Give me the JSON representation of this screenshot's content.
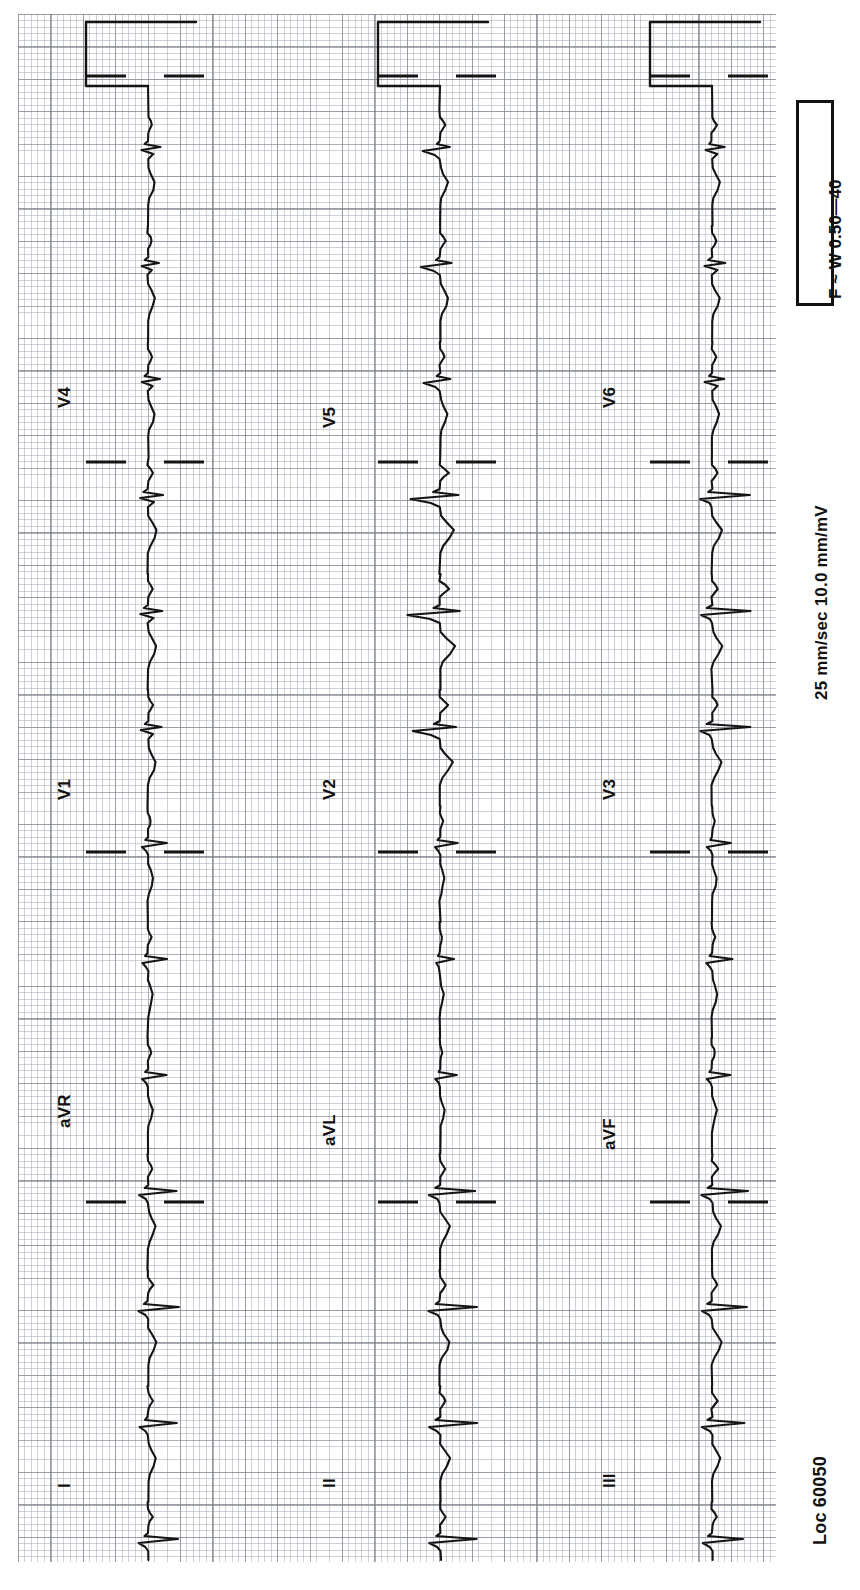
{
  "document": {
    "type": "12-lead-electrocardiogram",
    "orientation": "rotated-90-ccw",
    "paper": {
      "small_box_px": 6.48,
      "large_box_px": 32.4,
      "grid_color_minor": "#969ba5",
      "grid_color_major": "#787d87",
      "background": "#ffffff",
      "trace_color": "#111111"
    }
  },
  "settings": {
    "paper_speed": "25 mm/sec",
    "gain": "10.0 mm/mV",
    "speed_gain_line": "25 mm/sec   10.0 mm/mV",
    "filter": "F ~ W 0.50—40",
    "location": "Loc 60050"
  },
  "leads": {
    "columns": [
      {
        "name": "column-1",
        "baseline_x": 148,
        "labels": [
          {
            "text": "I",
            "x": 55,
            "y": 1488
          },
          {
            "text": "aVR",
            "x": 55,
            "y": 1128
          },
          {
            "text": "V1",
            "x": 55,
            "y": 800
          },
          {
            "text": "V4",
            "x": 55,
            "y": 408
          }
        ]
      },
      {
        "name": "column-2",
        "baseline_x": 440,
        "labels": [
          {
            "text": "II",
            "x": 320,
            "y": 1488
          },
          {
            "text": "aVL",
            "x": 320,
            "y": 1146
          },
          {
            "text": "V2",
            "x": 320,
            "y": 800
          },
          {
            "text": "V5",
            "x": 320,
            "y": 428
          }
        ]
      },
      {
        "name": "column-3",
        "baseline_x": 712,
        "labels": [
          {
            "text": "III",
            "x": 600,
            "y": 1488
          },
          {
            "text": "aVF",
            "x": 600,
            "y": 1150
          },
          {
            "text": "V3",
            "x": 600,
            "y": 800
          },
          {
            "text": "V6",
            "x": 600,
            "y": 408
          }
        ]
      }
    ],
    "order_top_to_bottom": [
      "V4/V5/V6",
      "V1/V2/V3",
      "aVR/aVL/aVF",
      "I/II/III"
    ],
    "lead_names": [
      "I",
      "II",
      "III",
      "aVR",
      "aVL",
      "aVF",
      "V1",
      "V2",
      "V3",
      "V4",
      "V5",
      "V6"
    ]
  },
  "calibration": {
    "label": "calibration-pulse",
    "amplitude_mm": 10,
    "present_on_columns": [
      1,
      2,
      3
    ]
  },
  "chart_data": {
    "type": "line",
    "xlabel": "Time (25 mm/sec)",
    "ylabel": "Amplitude (10.0 mm/mV)",
    "grid": true,
    "legend": "none",
    "note": "Rotated strip chart; time runs top-to-bottom, amplitude left-to-right.",
    "rows": [
      {
        "row": 1,
        "y_from": 14,
        "y_to": 400,
        "leads": [
          "V4",
          "V5",
          "V6"
        ]
      },
      {
        "row": 2,
        "y_from": 400,
        "y_to": 790,
        "leads": [
          "V1",
          "V2",
          "V3"
        ]
      },
      {
        "row": 3,
        "y_from": 790,
        "y_to": 1140,
        "leads": [
          "aVR",
          "aVL",
          "aVF"
        ]
      },
      {
        "row": 4,
        "y_from": 1140,
        "y_to": 1562,
        "leads": [
          "I",
          "II",
          "III"
        ]
      }
    ],
    "beat_interval_px": 116,
    "beat_count_per_column": 13
  },
  "filter_box_text": "F ~ W 0.50—40",
  "speed_text": "25 mm/sec   10.0 mm/mV",
  "loc_text": "Loc 60050"
}
